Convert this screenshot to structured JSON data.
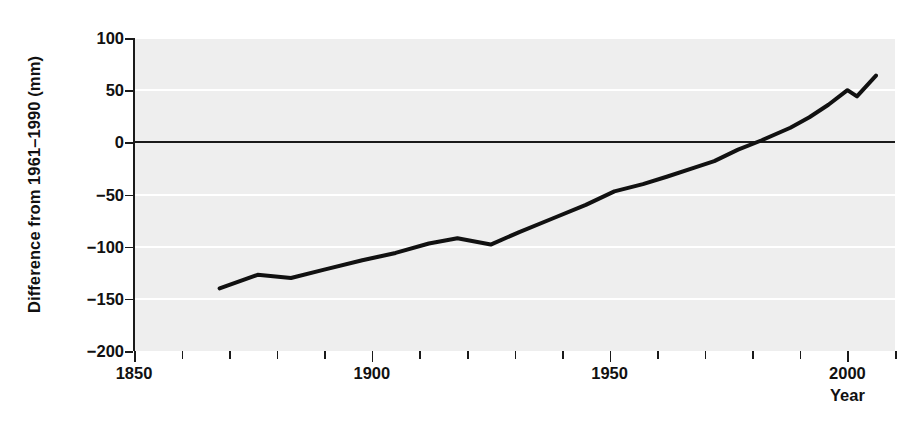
{
  "chart_data": {
    "type": "line",
    "title": "",
    "xlabel": "Year",
    "ylabel": "Difference from 1961–1990 (mm)",
    "xlim": [
      1850,
      2010
    ],
    "ylim": [
      -200,
      100
    ],
    "grid": true,
    "legend": "none",
    "x_ticks_major": [
      1850,
      1900,
      1950,
      2000
    ],
    "x_tick_labels": [
      "1850",
      "1900",
      "1950",
      "2000"
    ],
    "x_tick_minor_step": 10,
    "y_ticks": [
      100,
      50,
      0,
      -50,
      -100,
      -150,
      -200
    ],
    "y_tick_labels": [
      "100",
      "50",
      "0",
      "−50",
      "−100",
      "−150",
      "−200"
    ],
    "series": [
      {
        "name": "Global mean sea level difference",
        "color": "#111111",
        "line_width": 4,
        "x": [
          1868,
          1876,
          1883,
          1890,
          1898,
          1905,
          1912,
          1918,
          1925,
          1931,
          1938,
          1945,
          1951,
          1957,
          1962,
          1968,
          1972,
          1977,
          1982,
          1988,
          1992,
          1996,
          2000,
          2002,
          2006
        ],
        "y": [
          -140,
          -127,
          -130,
          -122,
          -113,
          -106,
          -97,
          -92,
          -98,
          -86,
          -73,
          -60,
          -47,
          -40,
          -33,
          -24,
          -18,
          -7,
          2,
          14,
          24,
          36,
          50,
          44,
          64
        ]
      }
    ],
    "annotations": []
  },
  "axes": {
    "y_axis_title": "Difference from 1961–1990 (mm)",
    "x_axis_title": "Year"
  },
  "style": {
    "plot_background": "#eeeeee",
    "gridline_color": "#ffffff",
    "axis_color": "#1a1a1a",
    "series_color": "#111111",
    "page_background": "#ffffff"
  }
}
